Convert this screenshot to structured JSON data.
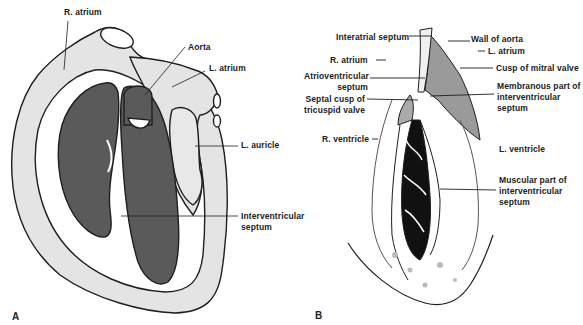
{
  "figure": {
    "colors": {
      "background": "#ffffff",
      "wall_light": "#e4e4e4",
      "chamber_dark": "#5a5a5a",
      "outline": "#1e1e1e",
      "trabeculae": "#111111"
    },
    "panel_a": {
      "letter": "A",
      "labels": {
        "r_atrium": "R. atrium",
        "aorta": "Aorta",
        "l_atrium": "L. atrium",
        "l_auricle": "L. auricle",
        "interventricular_septum_1": "Interventricular",
        "interventricular_septum_2": "septum"
      }
    },
    "panel_b": {
      "letter": "B",
      "labels": {
        "interatrial_septum": "Interatrial septum",
        "wall_of_aorta": "Wall of aorta",
        "l_atrium": "L. atrium",
        "r_atrium": "R. atrium",
        "cusp_mitral": "Cusp of mitral valve",
        "av_septum_1": "Atrioventricular",
        "av_septum_2": "septum",
        "membranous_1": "Membranous part of",
        "membranous_2": "interventricular",
        "membranous_3": "septum",
        "septal_cusp_1": "Septal cusp of",
        "septal_cusp_2": "tricuspid valve",
        "r_ventricle": "R. ventricle",
        "l_ventricle": "L. ventricle",
        "muscular_1": "Muscular part of",
        "muscular_2": "interventricular",
        "muscular_3": "septum"
      }
    }
  }
}
